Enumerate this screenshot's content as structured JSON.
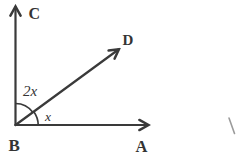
{
  "figure": {
    "type": "geometry-angle-diagram",
    "points": {
      "vertex": "B",
      "ray_up": "C",
      "ray_diagonal": "D",
      "ray_right": "A"
    },
    "angles": {
      "between_c_and_d": "2x",
      "between_d_and_a": "x"
    },
    "stray_mark_glyph": "\\",
    "colors": {
      "ink": "#3a3a3a",
      "background": "#ffffff",
      "stray_mark": "#9b9b9b"
    }
  }
}
